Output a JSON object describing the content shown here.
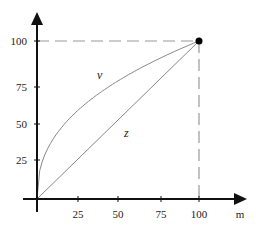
{
  "chart_data": {
    "type": "line",
    "title": "",
    "xlabel": "m",
    "ylabel": "",
    "xlim": [
      0,
      100
    ],
    "ylim": [
      0,
      100
    ],
    "grid": false,
    "legend": "none",
    "x_ticks": [
      "25",
      "50",
      "75",
      "100"
    ],
    "y_ticks": [
      "25",
      "50",
      "75",
      "100"
    ],
    "series": [
      {
        "name": "v",
        "style": "curve (concave)",
        "x": [
          0,
          5,
          10,
          25,
          50,
          75,
          100
        ],
        "y": [
          0,
          30,
          42,
          62,
          82,
          94,
          100
        ]
      },
      {
        "name": "z",
        "style": "straight line",
        "x": [
          0,
          100
        ],
        "y": [
          0,
          100
        ]
      }
    ],
    "annotations": [
      {
        "type": "point",
        "x": 100,
        "y": 100,
        "marker": "filled-circle"
      },
      {
        "type": "dashed-guide",
        "from": [
          0,
          100
        ],
        "to": [
          100,
          100
        ]
      },
      {
        "type": "dashed-guide",
        "from": [
          100,
          0
        ],
        "to": [
          100,
          100
        ]
      }
    ],
    "colors": {
      "axis": "#111111",
      "curve": "#888888",
      "guides": "#999999",
      "point": "#000000"
    }
  }
}
